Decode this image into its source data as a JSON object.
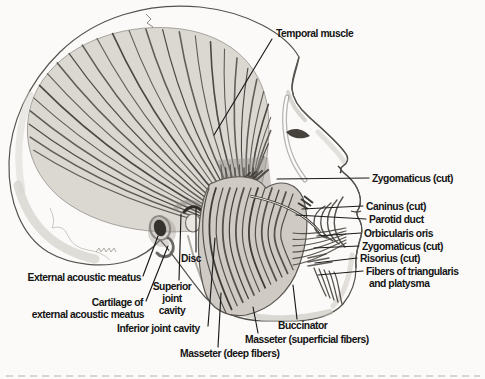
{
  "figure": {
    "type": "anatomical-diagram",
    "colors": {
      "background": "#fbfaf8",
      "ink": "#141414",
      "bone": "#efede8",
      "bone_shadow": "#c6c2bb",
      "muscle_fill": "#d9d5ce",
      "muscle_fiber_dark": "#3f3c38",
      "muscle_fiber_mid": "#57534e",
      "leader_line": "#1a1a1a"
    },
    "labels": [
      {
        "id": "temporal-muscle",
        "parts": [
          {
            "t": "Temporal muscle",
            "x": 276,
            "y": 37,
            "a": "start"
          }
        ],
        "leader": [
          [
            272,
            39
          ],
          [
            214,
            135
          ]
        ]
      },
      {
        "id": "zygomaticus-cut-upper",
        "parts": [
          {
            "t": "Zygomaticus (cut)",
            "x": 372,
            "y": 182,
            "a": "start"
          }
        ],
        "leader": [
          [
            369,
            178
          ],
          [
            277,
            179
          ]
        ]
      },
      {
        "id": "caninus-cut",
        "parts": [
          {
            "t": "Caninus (cut)",
            "x": 366,
            "y": 210,
            "a": "start"
          }
        ],
        "leader": [
          [
            363,
            206
          ],
          [
            302,
            209
          ]
        ]
      },
      {
        "id": "parotid-duct",
        "parts": [
          {
            "t": "Parotid duct",
            "x": 369,
            "y": 223,
            "a": "start"
          }
        ],
        "leader": [
          [
            366,
            219
          ],
          [
            296,
            215
          ]
        ]
      },
      {
        "id": "orbicularis-oris",
        "parts": [
          {
            "t": "Orbicularis oris",
            "x": 364,
            "y": 237,
            "a": "start"
          }
        ],
        "leader": [
          [
            361,
            233
          ],
          [
            317,
            236
          ]
        ]
      },
      {
        "id": "zygomaticus-cut-lower",
        "parts": [
          {
            "t": "Zygomaticus (cut)",
            "x": 362,
            "y": 250,
            "a": "start"
          }
        ],
        "leader": [
          [
            359,
            246
          ],
          [
            314,
            248
          ]
        ]
      },
      {
        "id": "risorius-cut",
        "parts": [
          {
            "t": "Risorius (cut)",
            "x": 360,
            "y": 262,
            "a": "start"
          }
        ],
        "leader": [
          [
            357,
            258
          ],
          [
            315,
            263
          ]
        ]
      },
      {
        "id": "fibers-of-triangularis-and-platysma",
        "parts": [
          {
            "t": "Fibers of triangularis",
            "x": 366,
            "y": 275,
            "a": "start"
          },
          {
            "t": "and platysma",
            "x": 369,
            "y": 287,
            "a": "start"
          }
        ],
        "leader": [
          [
            363,
            271
          ],
          [
            318,
            275
          ]
        ]
      },
      {
        "id": "external-acoustic-meatus",
        "parts": [
          {
            "t": "External acoustic meatus",
            "x": 141,
            "y": 281,
            "a": "end"
          }
        ],
        "leader": [
          [
            143,
            276
          ],
          [
            158,
            236
          ]
        ]
      },
      {
        "id": "cartilage-of-external-acoustic-meatus",
        "parts": [
          {
            "t": "Cartilage of",
            "x": 143,
            "y": 306,
            "a": "end"
          },
          {
            "t": "external acoustic meatus",
            "x": 144,
            "y": 318,
            "a": "end"
          }
        ],
        "leader": [
          [
            146,
            301
          ],
          [
            168,
            246
          ]
        ]
      },
      {
        "id": "disc",
        "parts": [
          {
            "t": "Disc",
            "x": 181,
            "y": 262,
            "a": "start"
          }
        ],
        "leader": [
          [
            196,
            252
          ],
          [
            196,
            208
          ]
        ]
      },
      {
        "id": "superior-joint-cavity",
        "parts": [
          {
            "t": "Superior",
            "x": 172,
            "y": 290,
            "a": "middle"
          },
          {
            "t": "joint",
            "x": 172,
            "y": 302,
            "a": "middle"
          },
          {
            "t": "cavity",
            "x": 172,
            "y": 314,
            "a": "middle"
          }
        ],
        "leader": [
          [
            179,
            280
          ],
          [
            181,
            214
          ]
        ]
      },
      {
        "id": "inferior-joint-cavity",
        "parts": [
          {
            "t": "Inferior joint cavity",
            "x": 117,
            "y": 332,
            "a": "start"
          }
        ],
        "leader": [
          [
            208,
            326
          ],
          [
            215,
            238
          ]
        ]
      },
      {
        "id": "masseter-deep-fibers",
        "parts": [
          {
            "t": "Masseter (deep fibers)",
            "x": 180,
            "y": 357,
            "a": "start"
          }
        ],
        "leader": [
          [
            218,
            347
          ],
          [
            221,
            293
          ]
        ]
      },
      {
        "id": "masseter-superficial-fibers",
        "parts": [
          {
            "t": "Masseter (superficial fibers)",
            "x": 245,
            "y": 343,
            "a": "start"
          }
        ],
        "leader": [
          [
            258,
            333
          ],
          [
            253,
            307
          ]
        ]
      },
      {
        "id": "buccinator",
        "parts": [
          {
            "t": "Buccinator",
            "x": 278,
            "y": 329,
            "a": "start"
          }
        ],
        "leader": [
          [
            297,
            319
          ],
          [
            293,
            285
          ]
        ]
      }
    ]
  }
}
